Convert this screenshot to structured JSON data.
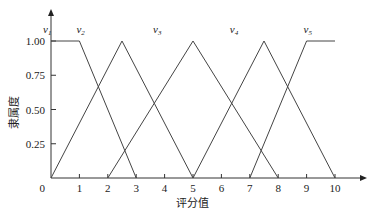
{
  "chart_data": {
    "type": "line",
    "title": "",
    "xlabel": "评分值",
    "ylabel": "隶属度",
    "xlim": [
      0,
      10
    ],
    "ylim": [
      0,
      1
    ],
    "x_ticks": [
      "0",
      "1",
      "2",
      "3",
      "4",
      "5",
      "6",
      "7",
      "8",
      "9",
      "10"
    ],
    "y_ticks": [
      "0",
      "0.25",
      "0.50",
      "0.75",
      "1.00"
    ],
    "grid": false,
    "legend": "none (series labeled inline above curves)",
    "series": [
      {
        "name": "v1",
        "x": [
          0,
          1,
          3
        ],
        "y": [
          1,
          1,
          0
        ]
      },
      {
        "name": "v2",
        "x": [
          0,
          2.5,
          5
        ],
        "y": [
          0,
          1,
          0
        ]
      },
      {
        "name": "v3",
        "x": [
          2,
          5,
          8
        ],
        "y": [
          0,
          1,
          0
        ]
      },
      {
        "name": "v4",
        "x": [
          5,
          7.5,
          10
        ],
        "y": [
          0,
          1,
          0
        ]
      },
      {
        "name": "v5",
        "x": [
          7,
          9,
          10
        ],
        "y": [
          0,
          1,
          1
        ]
      }
    ],
    "series_labels": [
      {
        "text": "v1",
        "x": 0,
        "y": 1.08
      },
      {
        "text": "v2",
        "x": 1,
        "y": 1.08
      },
      {
        "text": "v3",
        "x": 3.7,
        "y": 1.08
      },
      {
        "text": "v4",
        "x": 6.4,
        "y": 1.08
      },
      {
        "text": "v5",
        "x": 9,
        "y": 1.08
      }
    ]
  }
}
